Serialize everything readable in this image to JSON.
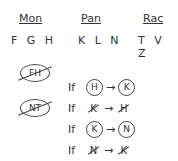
{
  "groups": [
    {
      "name": "Mon",
      "members": "F G H"
    },
    {
      "name": "Pan",
      "members": "K L N"
    },
    {
      "name": "Rac",
      "members": "T V Z"
    }
  ],
  "excluded_pairs": [
    "FH",
    "NT"
  ],
  "rules": [
    {
      "prefix": "If",
      "from": "H",
      "from_style": "circled",
      "arrow": "→",
      "to": "K",
      "to_style": "circled"
    },
    {
      "prefix": "If",
      "from": "K",
      "from_style": "crossed",
      "arrow": "→",
      "to": "H",
      "to_style": "crossed"
    },
    {
      "prefix": "If",
      "from": "K",
      "from_style": "circled",
      "arrow": "→",
      "to": "N",
      "to_style": "circled"
    },
    {
      "prefix": "If",
      "from": "N",
      "from_style": "crossed",
      "arrow": "→",
      "to": "K",
      "to_style": "crossed"
    }
  ]
}
